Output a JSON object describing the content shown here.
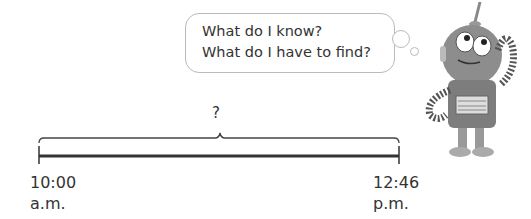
{
  "thought_bubble": {
    "lines": [
      "What do I know?",
      "What do I have to find?"
    ]
  },
  "number_line": {
    "unknown_label": "?",
    "start": {
      "time": "10:00",
      "period": "a.m."
    },
    "end": {
      "time": "12:46",
      "period": "p.m."
    }
  },
  "character": {
    "icon": "robot-thinking-icon"
  }
}
